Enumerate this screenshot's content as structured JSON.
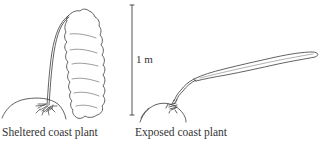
{
  "figure": {
    "panels": [
      {
        "id": "sheltered",
        "caption": "Sheltered coast plant"
      },
      {
        "id": "exposed",
        "caption": "Exposed coast plant"
      }
    ],
    "scale_bar": {
      "label": "1 m"
    }
  },
  "colors": {
    "ink": "#3a3a3a",
    "background": "#ffffff"
  }
}
